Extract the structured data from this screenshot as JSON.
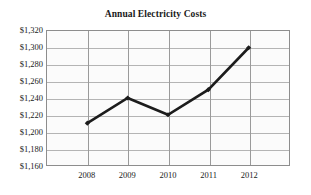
{
  "chart_data": {
    "type": "line",
    "title": "Annual Electricity Costs",
    "xlabel": "",
    "ylabel": "",
    "categories": [
      "2008",
      "2009",
      "2010",
      "2011",
      "2012"
    ],
    "values": [
      1210,
      1240,
      1220,
      1250,
      1300
    ],
    "value_labels": [
      "$1,210",
      "$1,240",
      "$1,220",
      "$1,250",
      "$1,300"
    ],
    "ylim": [
      1160,
      1320
    ],
    "ytick_values": [
      1320,
      1300,
      1280,
      1260,
      1240,
      1220,
      1200,
      1180,
      1160
    ],
    "ytick_labels": [
      "$1,320",
      "$1,300",
      "$1,280",
      "$1,260",
      "$1,240",
      "$1,220",
      "$1,200",
      "$1,180",
      "$1,160"
    ],
    "grid": true,
    "legend": false,
    "legend_position": "none",
    "series_color": "#1c1c1c",
    "marker": "diamond",
    "plot_background": "#fbfbfb",
    "gridline_color": "#b4b4b4",
    "border_color": "#8d8d8d"
  }
}
